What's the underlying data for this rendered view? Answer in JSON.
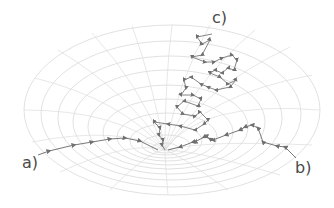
{
  "diagram": {
    "colors": {
      "grid": "#d6d6d6",
      "path": "#6e6e6e",
      "arrow": "#707070",
      "label": "#4a4a4a"
    },
    "labels": {
      "a": "a)",
      "b": "b)",
      "c": "c)"
    },
    "trajectories": [
      {
        "id": "a",
        "label": "a)",
        "shape": "smooth curve entering funnel from left"
      },
      {
        "id": "b",
        "label": "b)",
        "shape": "jagged path entering funnel from right"
      },
      {
        "id": "c",
        "label": "c)",
        "shape": "random-walk path descending from top into funnel"
      }
    ]
  }
}
